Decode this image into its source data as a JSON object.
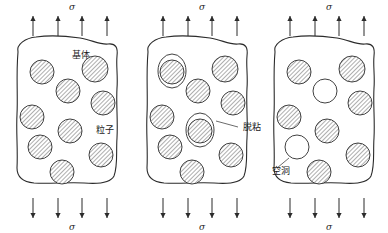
{
  "figure": {
    "type": "schematic-diagram",
    "background_color": "#ffffff",
    "line_color": "#2b2b2b",
    "panel_count": 3
  },
  "stress_symbol": "σ",
  "panels": [
    {
      "id": "panel-intact",
      "stage_order": 1,
      "top_stress_label": "σ",
      "bottom_stress_label": "σ",
      "top_arrow_count": 4,
      "bottom_arrow_count": 4,
      "top_arrow_direction": "up",
      "bottom_arrow_direction": "down",
      "labels": [
        {
          "name": "matrix",
          "text": "基体",
          "x": 72,
          "y": 58
        },
        {
          "name": "particle",
          "text": "粒子",
          "x": 96,
          "y": 133
        }
      ],
      "blob_path": "M 18,52 C 16,44 26,38 36,37 C 50,35 66,36 80,38 C 92,40 100,45 108,44 C 116,43 118,48 117,56 C 116,66 118,76 117,88 C 116,104 118,120 117,138 C 116,152 118,166 114,176 C 110,184 96,184 84,183 C 68,182 50,184 34,183 C 24,182 17,178 17,168 C 18,150 16,132 17,114 C 18,96 16,74 18,52 Z",
      "circles": [
        {
          "name": "particle",
          "cx": 42,
          "cy": 72,
          "r": 12,
          "fill": "hatched"
        },
        {
          "name": "particle",
          "cx": 95,
          "cy": 69,
          "r": 13,
          "fill": "hatched"
        },
        {
          "name": "particle",
          "cx": 68,
          "cy": 91,
          "r": 12,
          "fill": "hatched"
        },
        {
          "name": "particle",
          "cx": 103,
          "cy": 103,
          "r": 12,
          "fill": "hatched"
        },
        {
          "name": "particle",
          "cx": 32,
          "cy": 117,
          "r": 12,
          "fill": "hatched"
        },
        {
          "name": "particle",
          "cx": 70,
          "cy": 131,
          "r": 12,
          "fill": "hatched"
        },
        {
          "name": "particle",
          "cx": 40,
          "cy": 147,
          "r": 12,
          "fill": "hatched"
        },
        {
          "name": "particle",
          "cx": 101,
          "cy": 155,
          "r": 12,
          "fill": "hatched"
        },
        {
          "name": "particle",
          "cx": 62,
          "cy": 172,
          "r": 12,
          "fill": "hatched"
        }
      ],
      "debonds": [],
      "voids": []
    },
    {
      "id": "panel-debonding",
      "stage_order": 2,
      "top_stress_label": "σ",
      "bottom_stress_label": "σ",
      "top_arrow_count": 4,
      "bottom_arrow_count": 4,
      "top_arrow_direction": "up",
      "bottom_arrow_direction": "down",
      "labels": [
        {
          "name": "debonding",
          "text": "脱粘",
          "x": 243,
          "y": 130
        }
      ],
      "blob_path": "M 148,52 C 146,44 156,38 166,37 C 180,35 196,36 210,38 C 222,40 230,45 238,44 C 246,43 248,48 247,56 C 246,66 248,76 247,88 C 246,104 248,120 247,138 C 246,152 248,166 244,176 C 240,184 226,184 214,183 C 198,182 180,184 164,183 C 154,182 147,178 147,168 C 148,150 146,132 147,114 C 148,96 146,74 148,52 Z",
      "circles": [
        {
          "name": "particle-debonded",
          "cx": 172,
          "cy": 72,
          "r": 12,
          "fill": "hatched"
        },
        {
          "name": "particle",
          "cx": 225,
          "cy": 69,
          "r": 13,
          "fill": "hatched"
        },
        {
          "name": "particle",
          "cx": 198,
          "cy": 91,
          "r": 12,
          "fill": "hatched"
        },
        {
          "name": "particle",
          "cx": 233,
          "cy": 103,
          "r": 12,
          "fill": "hatched"
        },
        {
          "name": "particle",
          "cx": 162,
          "cy": 117,
          "r": 12,
          "fill": "hatched"
        },
        {
          "name": "particle-debonded",
          "cx": 200,
          "cy": 131,
          "r": 12,
          "fill": "hatched"
        },
        {
          "name": "particle",
          "cx": 170,
          "cy": 147,
          "r": 12,
          "fill": "hatched"
        },
        {
          "name": "particle",
          "cx": 231,
          "cy": 155,
          "r": 12,
          "fill": "hatched"
        },
        {
          "name": "particle",
          "cx": 192,
          "cy": 172,
          "r": 12,
          "fill": "hatched"
        }
      ],
      "debonds": [
        {
          "name": "debond-outline",
          "cx": 172,
          "cy": 71,
          "rx": 14,
          "ry": 17
        },
        {
          "name": "debond-outline",
          "cx": 200,
          "cy": 130,
          "rx": 14,
          "ry": 17
        }
      ],
      "leader": {
        "x1": 216,
        "y1": 121,
        "x2": 238,
        "y2": 127
      },
      "voids": []
    },
    {
      "id": "panel-voids",
      "stage_order": 3,
      "top_stress_label": "σ",
      "bottom_stress_label": "σ",
      "top_arrow_count": 4,
      "bottom_arrow_count": 4,
      "top_arrow_direction": "up",
      "bottom_arrow_direction": "down",
      "labels": [
        {
          "name": "void",
          "text": "空洞",
          "x": 272,
          "y": 174
        }
      ],
      "blob_path": "M 275,52 C 273,44 283,38 293,37 C 307,35 323,36 337,38 C 349,40 357,45 365,44 C 373,43 375,48 374,56 C 373,66 375,76 374,88 C 373,104 375,120 374,138 C 373,152 375,166 371,176 C 367,184 353,184 341,183 C 325,182 307,184 291,183 C 281,182 274,178 274,168 C 275,150 273,132 274,114 C 275,96 273,74 275,52 Z",
      "circles": [
        {
          "name": "particle",
          "cx": 299,
          "cy": 72,
          "r": 12,
          "fill": "hatched"
        },
        {
          "name": "particle",
          "cx": 352,
          "cy": 69,
          "r": 13,
          "fill": "hatched"
        },
        {
          "name": "void",
          "cx": 325,
          "cy": 91,
          "r": 12,
          "fill": "empty"
        },
        {
          "name": "particle",
          "cx": 360,
          "cy": 103,
          "r": 12,
          "fill": "hatched"
        },
        {
          "name": "particle",
          "cx": 289,
          "cy": 117,
          "r": 12,
          "fill": "hatched"
        },
        {
          "name": "particle",
          "cx": 327,
          "cy": 131,
          "r": 12,
          "fill": "hatched"
        },
        {
          "name": "void",
          "cx": 297,
          "cy": 147,
          "r": 12,
          "fill": "empty"
        },
        {
          "name": "particle",
          "cx": 358,
          "cy": 155,
          "r": 12,
          "fill": "hatched"
        },
        {
          "name": "particle",
          "cx": 319,
          "cy": 172,
          "r": 12,
          "fill": "hatched"
        }
      ],
      "debonds": [],
      "voids": [
        {
          "name": "void",
          "cx": 325,
          "cy": 91,
          "r": 12
        },
        {
          "name": "void",
          "cx": 297,
          "cy": 147,
          "r": 12
        }
      ],
      "leader": {
        "x1": 289,
        "y1": 158,
        "x2": 277,
        "y2": 168
      }
    }
  ],
  "arrow_rows": {
    "top_y_start": 16,
    "top_y_end": 36,
    "bottom_y_start": 198,
    "bottom_y_end": 218,
    "x_positions": [
      [
        33,
        58,
        82,
        107
      ],
      [
        163,
        188,
        212,
        237
      ],
      [
        290,
        315,
        339,
        364
      ]
    ]
  },
  "stress_label_positions": {
    "top_y": 10,
    "bottom_y": 230,
    "x": [
      72,
      202,
      329
    ]
  }
}
